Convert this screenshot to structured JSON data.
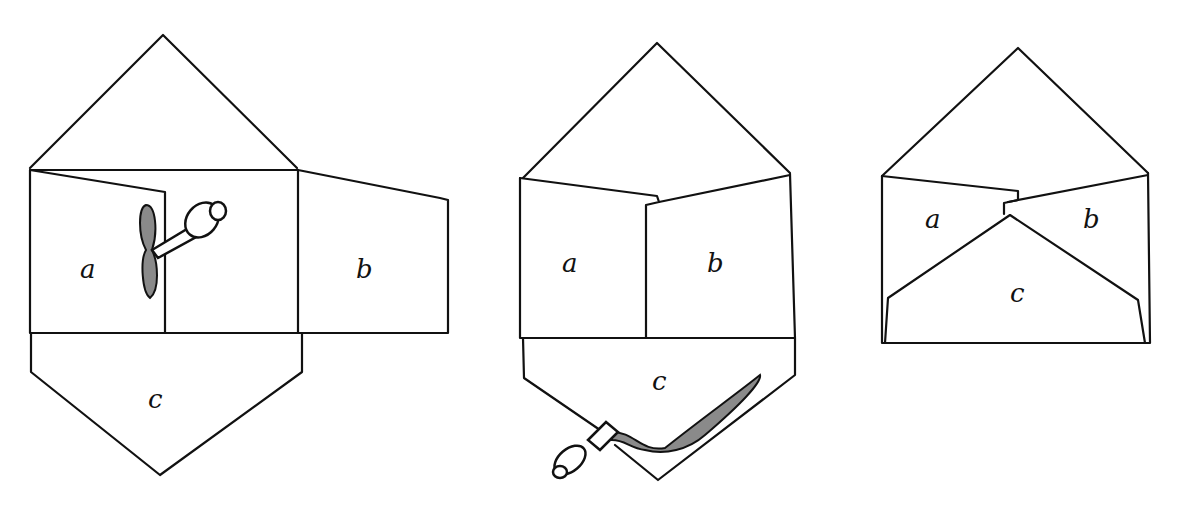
{
  "diagram": {
    "type": "envelope folding instructions",
    "steps": [
      {
        "id": "step-1",
        "labels": {
          "a": "a",
          "b": "b",
          "c": "c"
        },
        "note": "flap a folded in, glue tube applying glue along edge"
      },
      {
        "id": "step-2",
        "labels": {
          "a": "a",
          "b": "b",
          "c": "c"
        },
        "note": "flaps a and b folded in, glue applied along bottom flap c"
      },
      {
        "id": "step-3",
        "labels": {
          "a": "a",
          "b": "b",
          "c": "c"
        },
        "note": "bottom flap c folded up over a and b"
      }
    ],
    "colors": {
      "line": "#111111",
      "glue": "#8a8a8a",
      "background": "#ffffff"
    }
  }
}
